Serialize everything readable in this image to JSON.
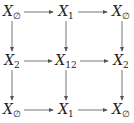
{
  "diagram": {
    "type": "commutative-diagram",
    "nodes": [
      {
        "id": "r0c0",
        "base": "X",
        "sub": "∅",
        "x": 12,
        "y": 12
      },
      {
        "id": "r0c1",
        "base": "X",
        "sub": "1",
        "x": 66,
        "y": 12
      },
      {
        "id": "r0c2",
        "base": "X",
        "sub": "∅",
        "x": 120,
        "y": 12
      },
      {
        "id": "r1c0",
        "base": "X",
        "sub": "2",
        "x": 12,
        "y": 61
      },
      {
        "id": "r1c1",
        "base": "X",
        "sub": "12",
        "x": 66,
        "y": 61
      },
      {
        "id": "r1c2",
        "base": "X",
        "sub": "2",
        "x": 120,
        "y": 61
      },
      {
        "id": "r2c0",
        "base": "X",
        "sub": "∅",
        "x": 12,
        "y": 110
      },
      {
        "id": "r2c1",
        "base": "X",
        "sub": "1",
        "x": 66,
        "y": 110
      },
      {
        "id": "r2c2",
        "base": "X",
        "sub": "∅",
        "x": 120,
        "y": 110
      }
    ],
    "edges": [
      {
        "from": "r0c0",
        "to": "r0c1"
      },
      {
        "from": "r0c1",
        "to": "r0c2"
      },
      {
        "from": "r1c0",
        "to": "r1c1"
      },
      {
        "from": "r1c1",
        "to": "r1c2"
      },
      {
        "from": "r2c0",
        "to": "r2c1"
      },
      {
        "from": "r2c1",
        "to": "r2c2"
      },
      {
        "from": "r0c0",
        "to": "r1c0"
      },
      {
        "from": "r1c0",
        "to": "r2c0"
      },
      {
        "from": "r0c1",
        "to": "r1c1"
      },
      {
        "from": "r1c1",
        "to": "r2c1"
      },
      {
        "from": "r0c2",
        "to": "r1c2"
      },
      {
        "from": "r1c2",
        "to": "r2c2"
      }
    ],
    "colors": {
      "arrow": "#555555",
      "text": "#222222"
    }
  }
}
